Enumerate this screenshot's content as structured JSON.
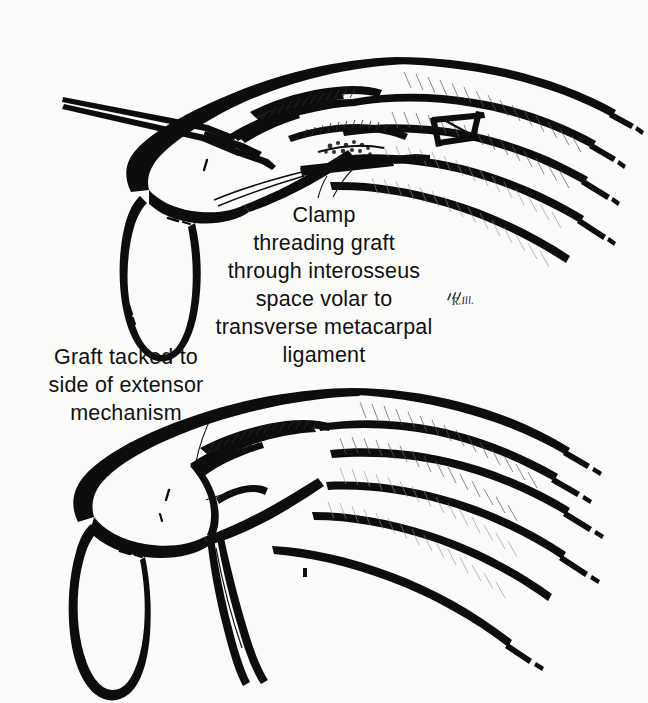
{
  "figure": {
    "background_color": "#fbfbfa",
    "ink_color": "#0d0d0d",
    "panels": [
      {
        "id": "upper",
        "name": "clamp-threading-graft-panel",
        "description": "Dorsal view of hand with incision, clamp threading graft through interosseus space"
      },
      {
        "id": "lower",
        "name": "graft-tacked-panel",
        "description": "Dorsal view of hand with graft tacked to side of extensor mechanism"
      }
    ]
  },
  "captions": {
    "clamp": {
      "name": "clamp-caption",
      "lines": [
        "Clamp",
        "threading graft",
        "through interosseus",
        "space volar to",
        "transverse metacarpal",
        "ligament"
      ]
    },
    "graft": {
      "name": "graft-caption",
      "lines": [
        "Graft tacked to",
        "side of extensor",
        "mechanism"
      ]
    }
  },
  "signature": {
    "name": "artist-signature",
    "text": "R.Ill."
  }
}
